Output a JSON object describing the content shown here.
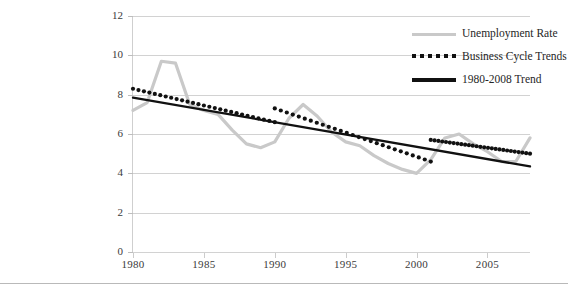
{
  "chart_data": {
    "type": "line",
    "title": "",
    "xlabel": "",
    "ylabel": "",
    "xlim": [
      1980,
      2008
    ],
    "ylim": [
      0,
      12
    ],
    "ytick_labels": [
      "0",
      "2",
      "4",
      "6",
      "8",
      "10",
      "12"
    ],
    "ytick_values": [
      0,
      2,
      4,
      6,
      8,
      10,
      12
    ],
    "xtick_labels": [
      "1980",
      "1985",
      "1990",
      "1995",
      "2000",
      "2005"
    ],
    "xtick_values": [
      1980,
      1985,
      1990,
      1995,
      2000,
      2005
    ],
    "grid": "horizontal",
    "legend_position": "top-right",
    "series": [
      {
        "name": "Unemployment Rate",
        "style": "solid",
        "color": "#c9c9c9",
        "x": [
          1980,
          1981,
          1982,
          1983,
          1984,
          1985,
          1986,
          1987,
          1988,
          1989,
          1990,
          1991,
          1992,
          1993,
          1994,
          1995,
          1996,
          1997,
          1998,
          1999,
          2000,
          2001,
          2002,
          2003,
          2004,
          2005,
          2006,
          2007,
          2008
        ],
        "values": [
          7.2,
          7.6,
          9.7,
          9.6,
          7.5,
          7.2,
          7.0,
          6.2,
          5.5,
          5.3,
          5.6,
          6.8,
          7.5,
          6.9,
          6.1,
          5.6,
          5.4,
          4.9,
          4.5,
          4.2,
          4.0,
          4.7,
          5.8,
          6.0,
          5.5,
          5.1,
          4.6,
          4.6,
          5.8
        ]
      },
      {
        "name": "Business Cycle Trends",
        "style": "dotted",
        "color": "#111111",
        "segments": [
          {
            "x": [
              1980,
              1990
            ],
            "values": [
              8.3,
              6.6
            ]
          },
          {
            "x": [
              1990,
              2001
            ],
            "values": [
              7.3,
              4.6
            ]
          },
          {
            "x": [
              2001,
              2008
            ],
            "values": [
              5.7,
              5.0
            ]
          }
        ]
      },
      {
        "name": "1980-2008 Trend",
        "style": "solid",
        "color": "#111111",
        "x": [
          1980,
          2008
        ],
        "values": [
          7.85,
          4.35
        ]
      }
    ]
  },
  "legend": {
    "items": [
      {
        "label": "Unemployment Rate",
        "swatch": "grey-line-swatch"
      },
      {
        "label": "Business Cycle Trends",
        "swatch": "dotted-line-swatch"
      },
      {
        "label": "1980-2008 Trend",
        "swatch": "solid-line-swatch"
      }
    ]
  }
}
